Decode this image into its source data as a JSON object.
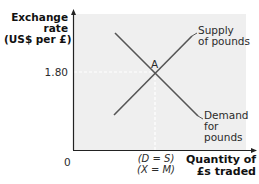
{
  "diagram": {
    "type": "supply-demand",
    "y_axis_label": [
      "Exchange",
      "rate",
      "(US$ per £)"
    ],
    "x_axis_label": [
      "Quantity of",
      "£s traded"
    ],
    "origin_label": "0",
    "y_tick_label": "1.80",
    "x_tick_label": [
      "(D = S)",
      "(X = M)"
    ],
    "equilibrium_label": "A",
    "supply_label": [
      "Supply",
      "of pounds"
    ],
    "demand_label": [
      "Demand",
      "for",
      "pounds"
    ]
  },
  "colors": {
    "plot_background": "#efefef",
    "axis": "#222222",
    "curve": "#555555",
    "guide": "#ffffff",
    "text": "#2b2b2b"
  }
}
